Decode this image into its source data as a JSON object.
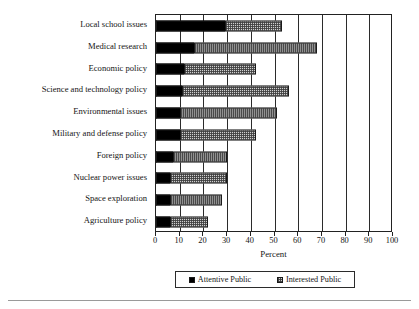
{
  "chart_data": {
    "type": "bar",
    "orientation": "horizontal",
    "stacked": true,
    "title": "",
    "xlabel": "Percent",
    "ylabel": "",
    "xlim": [
      0,
      100
    ],
    "xticks": [
      0,
      10,
      20,
      30,
      40,
      50,
      60,
      70,
      80,
      90,
      100
    ],
    "grid": true,
    "grid_axis": "x",
    "legend_position": "bottom",
    "categories": [
      "Local school issues",
      "Medical research",
      "Economic policy",
      "Science and technology policy",
      "Environmental issues",
      "Military and defense policy",
      "Foreign policy",
      "Nuclear power issues",
      "Space exploration",
      "Agriculture policy"
    ],
    "series": [
      {
        "name": "Attentive Public",
        "color": "#000000",
        "pattern": "solid",
        "values": [
          29,
          16,
          12,
          11,
          10,
          10,
          7,
          6,
          6,
          6
        ]
      },
      {
        "name": "Interested Public",
        "color": "#cfcfcf",
        "pattern": "checker-hatch",
        "values": [
          24,
          52,
          30,
          45,
          41,
          32,
          23,
          24,
          22,
          16
        ]
      }
    ],
    "totals": [
      53,
      68,
      42,
      56,
      51,
      42,
      30,
      30,
      28,
      22
    ]
  },
  "axis": {
    "x_title": "Percent",
    "tick_labels": [
      "0",
      "10",
      "20",
      "30",
      "40",
      "50",
      "60",
      "70",
      "80",
      "90",
      "100"
    ]
  },
  "legend": {
    "items": [
      {
        "label": "Attentive Public",
        "swatch": "black-square-icon"
      },
      {
        "label": "Interested Public",
        "swatch": "hatched-square-icon"
      }
    ]
  }
}
